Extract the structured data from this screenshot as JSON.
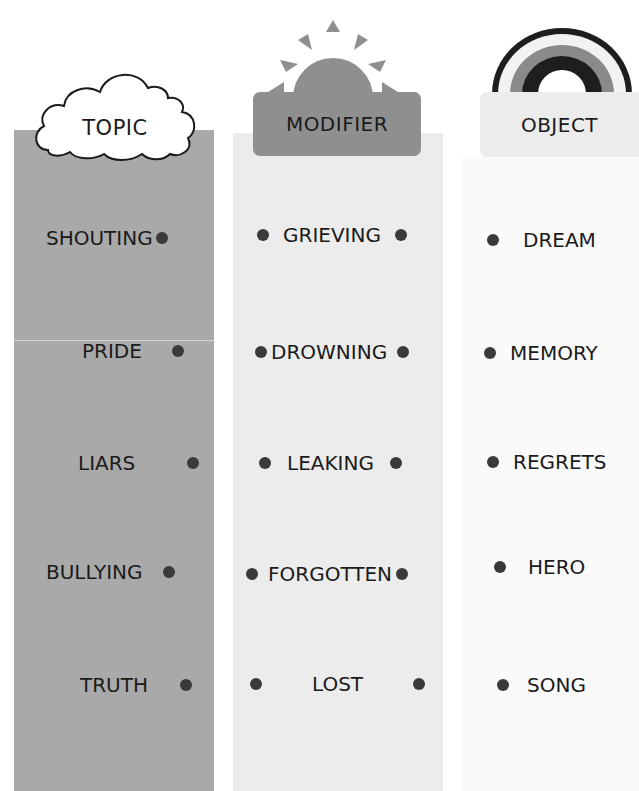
{
  "headers": {
    "topic": {
      "label": "TOPIC",
      "icon": "cloud-icon"
    },
    "modifier": {
      "label": "MODIFIER",
      "icon": "sun-icon"
    },
    "object": {
      "label": "OBJECT",
      "icon": "rainbow-icon"
    }
  },
  "columns": {
    "topic": {
      "color": "#a9a9a9",
      "items": [
        "SHOUTING",
        "PRIDE",
        "LIARS",
        "BULLYING",
        "TRUTH"
      ]
    },
    "modifier": {
      "color": "#ececec",
      "items": [
        "GRIEVING",
        "DROWNING",
        "LEAKING",
        "FORGOTTEN",
        "LOST"
      ]
    },
    "object": {
      "color": "#fafafa",
      "items": [
        "DREAM",
        "MEMORY",
        "REGRETS",
        "HERO",
        "SONG"
      ]
    }
  },
  "colors": {
    "dot": "#3a3a3a",
    "sun": "#8f8f8f",
    "rainbow_dark": "#1e1e1e",
    "rainbow_mid": "#8a8a8a",
    "rainbow_light": "#ececec"
  }
}
